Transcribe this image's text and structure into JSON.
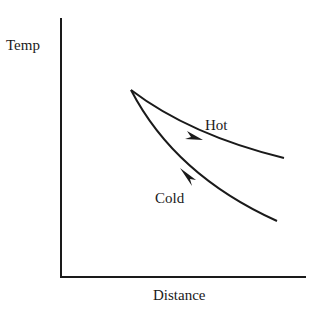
{
  "diagram": {
    "type": "temperature-profile",
    "y_axis_label": "Temp",
    "x_axis_label": "Distance",
    "curves": [
      {
        "name": "Hot",
        "label": "Hot",
        "direction": "left-to-right",
        "trend": "decreasing"
      },
      {
        "name": "Cold",
        "label": "Cold",
        "direction": "right-to-left",
        "trend": "decreasing"
      }
    ],
    "colors": {
      "line": "#1a1a1a",
      "background": "#ffffff"
    }
  }
}
